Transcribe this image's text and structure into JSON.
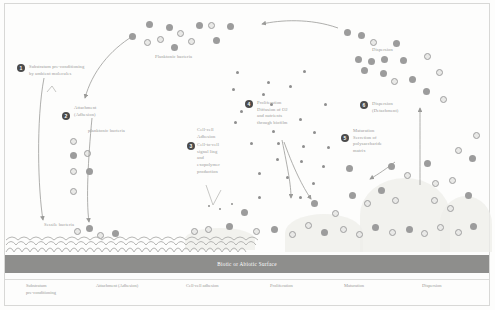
{
  "figure": {
    "surface_bar_label": "Biotic or Abiotic Surface",
    "planktonic_label": "Planktonic bacteria",
    "planktonic_label_2": "planktonic bacteria",
    "sessile_label": "Sessile bacteria",
    "dispersion_top_label": "Dispersion"
  },
  "steps": [
    {
      "num": "1",
      "title": "Substratum pre-conditioning",
      "detail": "by ambient molecules"
    },
    {
      "num": "2",
      "title": "Attachment",
      "detail": "(Adhesion)"
    },
    {
      "num": "3",
      "title": "Cell-cell",
      "detail": "Adhesion",
      "detail2": "Cell-to-cell",
      "detail3": "signal ling",
      "detail4": "and",
      "detail5": "exopolymer",
      "detail6": "production"
    },
    {
      "num": "4",
      "title": "Proliferation",
      "detail": "Diffusion of O2",
      "detail2": "and nutrients",
      "detail3": "through biofilm"
    },
    {
      "num": "5",
      "title": "Maturation",
      "detail": "Secretion of",
      "detail2": "polysaccharide",
      "detail3": "matrix"
    },
    {
      "num": "6",
      "title": "Dispersion",
      "detail": "(Detachment)"
    }
  ],
  "phases": [
    {
      "line1": "Substratum",
      "line2": "pre-conditioning"
    },
    {
      "line1": "Attachment (Adhesion)",
      "line2": ""
    },
    {
      "line1": "Cell-cell adhesion",
      "line2": ""
    },
    {
      "line1": "Proliferation",
      "line2": ""
    },
    {
      "line1": "Maturation",
      "line2": ""
    },
    {
      "line1": "Dispersion",
      "line2": ""
    }
  ],
  "colors": {
    "surface_bar": "#8e8e8c",
    "cell_solid": "#9c9c9c",
    "cell_ring_stroke": "#9f9f9f",
    "text": "#9a9a98",
    "badge": "#4b4b4b"
  }
}
